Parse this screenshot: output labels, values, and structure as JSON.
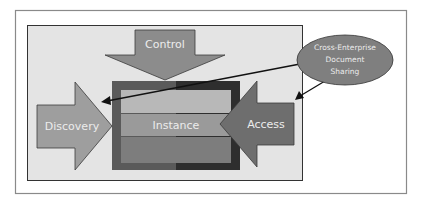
{
  "diagram": {
    "labels": {
      "control": "Control",
      "discovery": "Discovery",
      "instance": "Instance",
      "access": "Access",
      "xds_line1": "Cross-Enterprise",
      "xds_line2": "Document",
      "xds_line3": "Sharing"
    },
    "colors": {
      "frame_border": "#8a8a8a",
      "panel_fill": "#e4e4e4",
      "panel_border": "#333333",
      "arrow_fill": "#8c8c8c",
      "discovery_fill": "#9e9e9e",
      "access_fill": "#6e6e6e",
      "box_left": "#5a5a5a",
      "box_right": "#2e2e2e",
      "band_top": "#b8b8b8",
      "band_mid": "#9a9a9a",
      "band_bottom": "#7d7d7d",
      "ellipse_fill": "#7f7f7f"
    }
  }
}
